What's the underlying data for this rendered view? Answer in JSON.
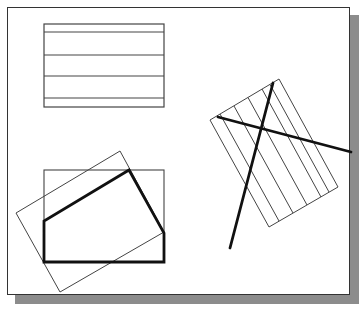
{
  "colors": {
    "background": "#ffffff",
    "frame": "#333333",
    "shadow": "#8c8c8c",
    "thin_stroke": "#444444",
    "thick_stroke": "#111111"
  },
  "diagram": {
    "top_rect": {
      "x": 44,
      "y": 24,
      "w": 120,
      "h": 83,
      "hatch_y": [
        32,
        55,
        76,
        98
      ]
    },
    "bottom_rect": {
      "x": 44,
      "y": 170,
      "w": 120,
      "h": 92
    },
    "bottom_rotated_rect": [
      [
        16,
        213
      ],
      [
        120,
        151
      ],
      [
        164,
        232
      ],
      [
        60,
        292
      ]
    ],
    "bold_polygon": [
      [
        44,
        262
      ],
      [
        44,
        221
      ],
      [
        129,
        170
      ],
      [
        164,
        233
      ],
      [
        164,
        262
      ]
    ],
    "right_rotated_rect": [
      [
        210,
        120
      ],
      [
        279,
        79
      ],
      [
        338,
        187
      ],
      [
        269,
        227
      ]
    ],
    "right_hatch_count": 6,
    "bold_lines": [
      [
        [
          218,
          117
        ],
        [
          351,
          152
        ]
      ],
      [
        [
          273,
          83
        ],
        [
          230,
          248
        ]
      ]
    ]
  }
}
